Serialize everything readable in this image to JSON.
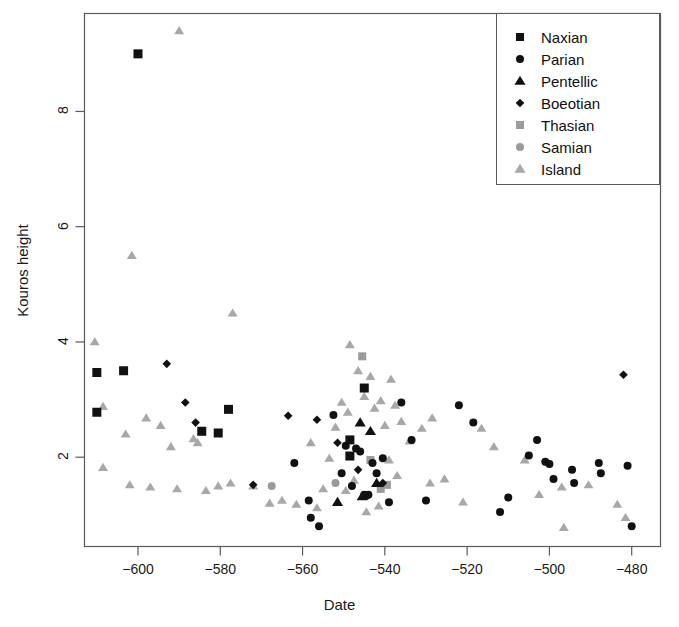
{
  "chart_data": {
    "type": "scatter",
    "title": "",
    "xlabel": "Date",
    "ylabel": "Kouros height",
    "xlim": [
      -613,
      -473
    ],
    "ylim": [
      0.45,
      9.7
    ],
    "xticks": [
      -600,
      -580,
      -560,
      -540,
      -520,
      -500,
      -480
    ],
    "xtick_labels": [
      "−600",
      "−580",
      "−560",
      "−540",
      "−520",
      "−500",
      "−480"
    ],
    "yticks": [
      2,
      4,
      6,
      8
    ],
    "ytick_labels": [
      "2",
      "4",
      "6",
      "8"
    ],
    "grid": false,
    "legend_position": "top-right",
    "series": [
      {
        "name": "Naxian",
        "marker": "square",
        "color": "#111111",
        "size": 9,
        "points": [
          [
            -600.0,
            9.0
          ],
          [
            -610.0,
            3.47
          ],
          [
            -603.5,
            3.5
          ],
          [
            -610.0,
            2.78
          ],
          [
            -584.5,
            2.45
          ],
          [
            -580.5,
            2.42
          ],
          [
            -578.0,
            2.83
          ],
          [
            -545.0,
            3.2
          ],
          [
            -548.5,
            2.3
          ],
          [
            -548.5,
            2.02
          ]
        ]
      },
      {
        "name": "Parian",
        "marker": "circle",
        "color": "#111111",
        "size": 8,
        "points": [
          [
            -562.0,
            1.9
          ],
          [
            -558.5,
            1.25
          ],
          [
            -558.0,
            0.95
          ],
          [
            -556.0,
            0.8
          ],
          [
            -552.5,
            2.73
          ],
          [
            -550.5,
            1.72
          ],
          [
            -549.5,
            2.2
          ],
          [
            -548.0,
            1.5
          ],
          [
            -547.0,
            2.15
          ],
          [
            -546.0,
            2.1
          ],
          [
            -545.0,
            1.35
          ],
          [
            -544.5,
            1.33
          ],
          [
            -544.0,
            1.35
          ],
          [
            -543.0,
            1.9
          ],
          [
            -542.0,
            1.72
          ],
          [
            -540.5,
            1.98
          ],
          [
            -539.0,
            1.22
          ],
          [
            -536.0,
            2.95
          ],
          [
            -533.5,
            2.3
          ],
          [
            -530.0,
            1.25
          ],
          [
            -522.0,
            2.9
          ],
          [
            -518.5,
            2.6
          ],
          [
            -512.0,
            1.05
          ],
          [
            -510.0,
            1.3
          ],
          [
            -505.0,
            2.03
          ],
          [
            -503.0,
            2.3
          ],
          [
            -501.0,
            1.92
          ],
          [
            -500.0,
            1.88
          ],
          [
            -499.0,
            1.62
          ],
          [
            -494.5,
            1.78
          ],
          [
            -494.0,
            1.55
          ],
          [
            -488.0,
            1.9
          ],
          [
            -487.5,
            1.72
          ],
          [
            -481.0,
            1.85
          ],
          [
            -480.0,
            0.8
          ]
        ]
      },
      {
        "name": "Pentellic",
        "marker": "triangle",
        "color": "#111111",
        "size": 9,
        "points": [
          [
            -546.0,
            2.6
          ],
          [
            -543.5,
            2.45
          ],
          [
            -542.0,
            1.55
          ],
          [
            -545.5,
            1.32
          ],
          [
            -551.5,
            1.22
          ]
        ]
      },
      {
        "name": "Boeotian",
        "marker": "diamond",
        "color": "#111111",
        "size": 6,
        "points": [
          [
            -593.0,
            3.62
          ],
          [
            -588.5,
            2.95
          ],
          [
            -586.0,
            2.6
          ],
          [
            -572.0,
            1.52
          ],
          [
            -563.5,
            2.72
          ],
          [
            -556.5,
            2.65
          ],
          [
            -551.5,
            2.25
          ],
          [
            -546.5,
            1.78
          ],
          [
            -540.5,
            1.55
          ],
          [
            -482.0,
            3.43
          ]
        ]
      },
      {
        "name": "Thasian",
        "marker": "square",
        "color": "#9a9a9a",
        "size": 8,
        "points": [
          [
            -545.5,
            3.75
          ],
          [
            -543.5,
            1.95
          ],
          [
            -541.0,
            1.45
          ],
          [
            -539.5,
            1.52
          ]
        ]
      },
      {
        "name": "Samian",
        "marker": "circle",
        "color": "#9a9a9a",
        "size": 8,
        "points": [
          [
            -567.5,
            1.5
          ],
          [
            -552.0,
            1.55
          ]
        ]
      },
      {
        "name": "Island",
        "marker": "triangle",
        "color": "#a8a8a8",
        "size": 8,
        "points": [
          [
            -590.0,
            9.4
          ],
          [
            -601.5,
            5.5
          ],
          [
            -577.0,
            4.5
          ],
          [
            -610.5,
            4.0
          ],
          [
            -608.5,
            2.88
          ],
          [
            -603.0,
            2.4
          ],
          [
            -598.0,
            2.68
          ],
          [
            -594.5,
            2.55
          ],
          [
            -592.0,
            2.18
          ],
          [
            -586.5,
            2.32
          ],
          [
            -585.5,
            2.25
          ],
          [
            -608.5,
            1.82
          ],
          [
            -602.0,
            1.52
          ],
          [
            -597.0,
            1.48
          ],
          [
            -590.5,
            1.45
          ],
          [
            -583.5,
            1.42
          ],
          [
            -580.5,
            1.5
          ],
          [
            -577.5,
            1.55
          ],
          [
            -572.0,
            1.5
          ],
          [
            -568.0,
            1.2
          ],
          [
            -565.0,
            1.25
          ],
          [
            -561.5,
            1.18
          ],
          [
            -556.5,
            1.12
          ],
          [
            -552.0,
            2.52
          ],
          [
            -550.5,
            2.95
          ],
          [
            -549.0,
            2.78
          ],
          [
            -548.5,
            3.95
          ],
          [
            -546.5,
            3.5
          ],
          [
            -545.0,
            3.05
          ],
          [
            -543.5,
            3.4
          ],
          [
            -542.5,
            2.85
          ],
          [
            -541.0,
            2.98
          ],
          [
            -540.0,
            2.55
          ],
          [
            -538.5,
            3.35
          ],
          [
            -537.5,
            2.9
          ],
          [
            -536.0,
            2.62
          ],
          [
            -534.0,
            2.28
          ],
          [
            -539.0,
            1.95
          ],
          [
            -537.0,
            1.68
          ],
          [
            -541.5,
            1.15
          ],
          [
            -544.5,
            1.05
          ],
          [
            -547.5,
            1.6
          ],
          [
            -549.5,
            1.42
          ],
          [
            -553.5,
            1.98
          ],
          [
            -555.0,
            1.45
          ],
          [
            -558.0,
            2.25
          ],
          [
            -531.0,
            2.5
          ],
          [
            -528.5,
            2.68
          ],
          [
            -529.0,
            1.55
          ],
          [
            -525.5,
            1.62
          ],
          [
            -521.0,
            1.22
          ],
          [
            -516.5,
            2.5
          ],
          [
            -513.5,
            2.18
          ],
          [
            -506.0,
            1.95
          ],
          [
            -502.5,
            1.35
          ],
          [
            -497.0,
            1.48
          ],
          [
            -496.5,
            0.78
          ],
          [
            -490.5,
            1.52
          ],
          [
            -483.5,
            1.18
          ],
          [
            -481.5,
            0.95
          ]
        ]
      }
    ]
  },
  "legend": {
    "entries": [
      {
        "label": "Naxian",
        "marker": "square",
        "color": "#111111"
      },
      {
        "label": "Parian",
        "marker": "circle",
        "color": "#111111"
      },
      {
        "label": "Pentellic",
        "marker": "triangle",
        "color": "#111111"
      },
      {
        "label": "Boeotian",
        "marker": "diamond",
        "color": "#111111"
      },
      {
        "label": "Thasian",
        "marker": "square",
        "color": "#9a9a9a"
      },
      {
        "label": "Samian",
        "marker": "circle",
        "color": "#9a9a9a"
      },
      {
        "label": "Island",
        "marker": "triangle",
        "color": "#a8a8a8"
      }
    ]
  },
  "colors": {
    "axis": "#5a5a5a",
    "text": "#1a1a1a",
    "background": "#ffffff",
    "dark_marker": "#111111",
    "gray_marker": "#9a9a9a",
    "light_gray_marker": "#a8a8a8"
  }
}
